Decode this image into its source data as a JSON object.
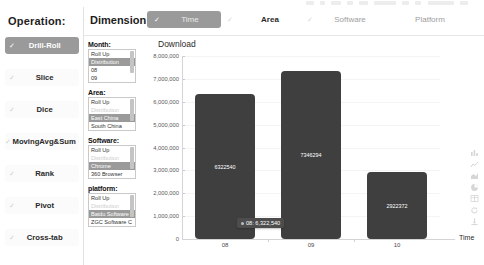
{
  "operation": {
    "title": "Operation:",
    "items": [
      {
        "label": "Drill-Roll",
        "selected": true
      },
      {
        "label": "Slice",
        "selected": false
      },
      {
        "label": "Dice",
        "selected": false
      },
      {
        "label": "MovingAvg&Sum",
        "selected": false
      },
      {
        "label": "Rank",
        "selected": false
      },
      {
        "label": "Pivot",
        "selected": false
      },
      {
        "label": "Cross-tab",
        "selected": false
      }
    ]
  },
  "dimension": {
    "title": "Dimension:",
    "tabs": [
      {
        "label": "Time",
        "selected": true
      },
      {
        "label": "Area",
        "selected": false
      },
      {
        "label": "Software",
        "selected": false
      },
      {
        "label": "Platform",
        "selected": false
      }
    ]
  },
  "filters": [
    {
      "caption": "Month:",
      "options": [
        {
          "label": "Roll Up",
          "state": "normal"
        },
        {
          "label": "Distribution",
          "state": "selected"
        },
        {
          "label": "08",
          "state": "normal"
        },
        {
          "label": "09",
          "state": "normal"
        }
      ]
    },
    {
      "caption": "Area:",
      "options": [
        {
          "label": "Roll Up",
          "state": "normal"
        },
        {
          "label": "Distribution",
          "state": "disabled"
        },
        {
          "label": "East China",
          "state": "selected"
        },
        {
          "label": "South China",
          "state": "normal"
        }
      ]
    },
    {
      "caption": "Software:",
      "options": [
        {
          "label": "Roll Up",
          "state": "normal"
        },
        {
          "label": "Distribution",
          "state": "disabled"
        },
        {
          "label": "Chrome",
          "state": "selected"
        },
        {
          "label": "360 Browser",
          "state": "normal"
        }
      ]
    },
    {
      "caption": "platform:",
      "options": [
        {
          "label": "Roll Up",
          "state": "normal"
        },
        {
          "label": "Distribution",
          "state": "disabled"
        },
        {
          "label": "Baidu Software",
          "state": "selected"
        },
        {
          "label": "ZGC Software C",
          "state": "normal"
        }
      ]
    }
  ],
  "chart_data": {
    "type": "bar",
    "title": "Download",
    "xlabel": "Time",
    "ylabel": "",
    "categories": [
      "08",
      "09",
      "10"
    ],
    "values": [
      6322540,
      7346294,
      2922372
    ],
    "value_labels": [
      "6322540",
      "7346294",
      "2922372"
    ],
    "ylim": [
      0,
      8000000
    ],
    "yticks": [
      0,
      1000000,
      2000000,
      3000000,
      4000000,
      5000000,
      6000000,
      7000000,
      8000000
    ],
    "ytick_labels": [
      "0",
      "1,000,000",
      "2,000,000",
      "3,000,000",
      "4,000,000",
      "5,000,000",
      "6,000,000",
      "7,000,000",
      "8,000,000"
    ],
    "grid": true,
    "legend": "none",
    "bar_color": "#3f3f3f",
    "tooltip": {
      "text": "08: 6,322,540",
      "category": "08",
      "value": 6322540
    }
  },
  "toolbar_icons": [
    "bar-chart-icon",
    "line-chart-icon",
    "area-chart-icon",
    "pie-chart-icon",
    "table-icon",
    "refresh-icon",
    "download-icon"
  ]
}
